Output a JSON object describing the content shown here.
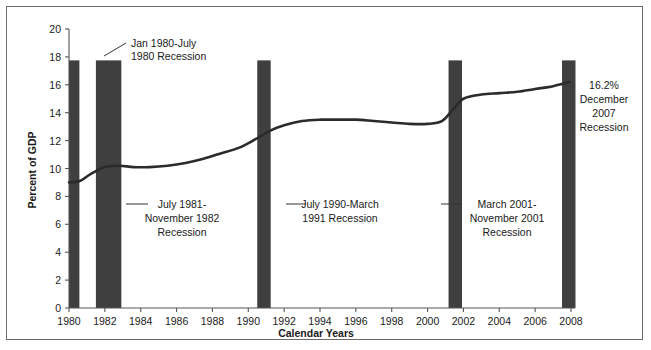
{
  "figure": {
    "background_color": "#ffffff",
    "frame_color": "#6b6b6b",
    "bar_color": "#3f3f3f",
    "line_color": "#2b2b2b"
  },
  "chart_data": {
    "type": "line",
    "title": "",
    "xlabel": "Calendar Years",
    "ylabel": "Percent of GDP",
    "xlim": [
      1980,
      2008
    ],
    "ylim": [
      0,
      20
    ],
    "grid": false,
    "legend": "none",
    "x_ticks": [
      1980,
      1982,
      1984,
      1986,
      1988,
      1990,
      1992,
      1994,
      1996,
      1998,
      2000,
      2002,
      2004,
      2006,
      2008
    ],
    "x_tick_labels": [
      "1980",
      "1982",
      "1984",
      "1986",
      "1988",
      "1990",
      "1992",
      "1994",
      "1996",
      "1998",
      "2000",
      "2002",
      "2004",
      "2006",
      "2008"
    ],
    "y_ticks": [
      0,
      2,
      4,
      6,
      8,
      10,
      12,
      14,
      16,
      18,
      20
    ],
    "y_tick_labels": [
      "0",
      "2",
      "4",
      "6",
      "8",
      "10",
      "12",
      "14",
      "16",
      "18",
      "20"
    ],
    "series": [
      {
        "name": "Health spending as percent of GDP",
        "x": [
          1980.0,
          1980.6,
          1981.2,
          1982.0,
          1982.8,
          1983.6,
          1984.5,
          1985.5,
          1986.5,
          1987.5,
          1988.5,
          1989.5,
          1990.4,
          1991.2,
          1992.0,
          1993.0,
          1994.0,
          1995.0,
          1996.0,
          1997.0,
          1998.0,
          1999.0,
          2000.0,
          2000.8,
          2001.4,
          2002.0,
          2003.0,
          2004.0,
          2005.0,
          2006.0,
          2007.0,
          2007.9
        ],
        "values": [
          9.0,
          9.1,
          9.6,
          10.1,
          10.2,
          10.1,
          10.1,
          10.2,
          10.4,
          10.7,
          11.1,
          11.5,
          12.1,
          12.7,
          13.1,
          13.4,
          13.5,
          13.5,
          13.5,
          13.4,
          13.3,
          13.2,
          13.2,
          13.4,
          14.2,
          15.0,
          15.3,
          15.4,
          15.5,
          15.7,
          15.9,
          16.2
        ]
      }
    ],
    "final_value_label": "16.2%",
    "recession_bands": [
      {
        "id": "recession-1980",
        "start": 1980.0,
        "end": 1980.58,
        "label_lines": [
          "Jan 1980-July",
          "1980 Recession"
        ]
      },
      {
        "id": "recession-1981-1982",
        "start": 1981.5,
        "end": 1982.92,
        "label_lines": [
          "July 1981-",
          "November 1982",
          "Recession"
        ]
      },
      {
        "id": "recession-1990-1991",
        "start": 1990.5,
        "end": 1991.25,
        "label_lines": [
          "July 1990-March",
          "1991 Recession"
        ]
      },
      {
        "id": "recession-2001",
        "start": 2001.17,
        "end": 2001.92,
        "label_lines": [
          "March 2001-",
          "November 2001",
          "Recession"
        ]
      },
      {
        "id": "recession-2007",
        "start": 2007.5,
        "end": 2008.25,
        "label_lines": [
          "16.2%",
          "December",
          "2007",
          "Recession"
        ]
      }
    ]
  },
  "annotations": {
    "a1": {
      "lines": [
        "Jan 1980-July",
        "1980 Recession"
      ]
    },
    "a2": {
      "lines": [
        "July 1981-",
        "November 1982",
        "Recession"
      ]
    },
    "a3": {
      "lines": [
        "July 1990-March",
        "1991 Recession"
      ]
    },
    "a4": {
      "lines": [
        "March 2001-",
        "November 2001",
        "Recession"
      ]
    },
    "a5": {
      "lines": [
        "16.2%",
        "December",
        "2007",
        "Recession"
      ]
    }
  }
}
